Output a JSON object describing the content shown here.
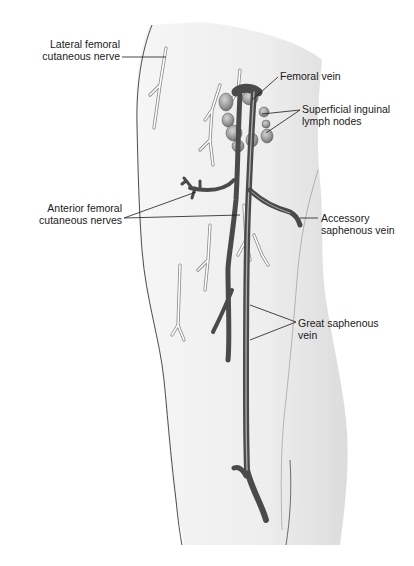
{
  "figure": {
    "colors": {
      "skin_fill": "#f1f1f1",
      "skin_outline": "#222222",
      "vein_dark": "#4a4a4a",
      "vein_highlight": "#9a9a9a",
      "nerve_outline": "#8a8a8a",
      "lymph_node": "#9d9d9d",
      "label_line": "#1a1a1a"
    }
  },
  "labels": {
    "lateral_femoral": {
      "line1": "Lateral femoral",
      "line2": "cutaneous nerve"
    },
    "femoral_vein": {
      "line1": "Femoral vein"
    },
    "inguinal_nodes": {
      "line1": "Superficial inguinal",
      "line2": "lymph nodes"
    },
    "anterior_femoral": {
      "line1": "Anterior femoral",
      "line2": "cutaneous nerves"
    },
    "accessory_saphenous": {
      "line1": "Accessory",
      "line2": "saphenous vein"
    },
    "great_saphenous": {
      "line1": "Great saphenous",
      "line2": "vein"
    }
  }
}
